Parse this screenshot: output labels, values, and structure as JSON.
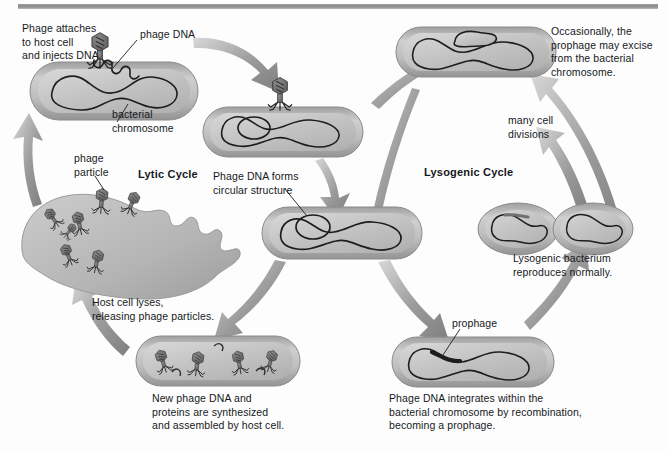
{
  "figure": {
    "title_bar": "",
    "cycles": [
      {
        "id": "lytic",
        "label": "Lytic Cycle"
      },
      {
        "id": "lysogenic",
        "label": "Lysogenic Cycle"
      }
    ],
    "labels": [
      {
        "name": "phage-attaches-caption",
        "text": "Phage attaches\nto host cell\nand injects DNA.",
        "x": 22,
        "y": 22
      },
      {
        "name": "phage-dna-label",
        "text": "phage DNA",
        "x": 140,
        "y": 28
      },
      {
        "name": "bacterial-chromosome-label",
        "text": "bacterial\nchromosome",
        "x": 112,
        "y": 108
      },
      {
        "name": "phage-particle-label",
        "text": "phage\nparticle",
        "x": 74,
        "y": 152
      },
      {
        "name": "lytic-cycle-label",
        "text": "Lytic Cycle",
        "x": 138,
        "y": 168
      },
      {
        "name": "circular-structure-caption",
        "text": "Phage DNA forms\ncircular structure",
        "x": 213,
        "y": 170
      },
      {
        "name": "host-cell-lyses-caption",
        "text": "Host cell lyses,\nreleasing phage particles.",
        "x": 92,
        "y": 296
      },
      {
        "name": "new-phage-dna-caption",
        "text": "New phage DNA and\nproteins are synthesized\nand assembled by host cell.",
        "x": 152,
        "y": 392
      },
      {
        "name": "lysogenic-cycle-label",
        "text": "Lysogenic Cycle",
        "x": 424,
        "y": 166
      },
      {
        "name": "occasionally-excise-caption",
        "text": "Occasionally, the\nprophage may excise\nfrom the bacterial\nchromosome.",
        "x": 551,
        "y": 25
      },
      {
        "name": "many-cell-divisions-label",
        "text": "many cell\ndivisions",
        "x": 508,
        "y": 114
      },
      {
        "name": "lysogenic-bacterium-caption",
        "text": "Lysogenic bacterium\nreproduces normally.",
        "x": 513,
        "y": 252
      },
      {
        "name": "prophage-label",
        "text": "prophage",
        "x": 452,
        "y": 317
      },
      {
        "name": "phage-dna-integrates-caption",
        "text": "Phage DNA integrates within the\nbacterial chromosome by recombination,\nbecoming a prophage.",
        "x": 389,
        "y": 392
      }
    ],
    "cells": [
      {
        "name": "host-cell-infected",
        "stage": "Phage attaches to host cell and injects DNA."
      },
      {
        "name": "cell-circularizing-dna",
        "stage": "Phage DNA forms circular structure"
      },
      {
        "name": "central-cell-with-circular-dna",
        "stage": "Decision point between lytic and lysogenic"
      },
      {
        "name": "cell-new-phages-assembled",
        "stage": "New phage DNA and proteins are synthesized and assembled by host cell."
      },
      {
        "name": "lysed-host-cell",
        "stage": "Host cell lyses, releasing phage particles."
      },
      {
        "name": "cell-with-prophage",
        "stage": "Phage DNA integrates within the bacterial chromosome by recombination, becoming a prophage."
      },
      {
        "name": "dividing-lysogenic-bacteria",
        "stage": "Lysogenic bacterium reproduces normally."
      },
      {
        "name": "cell-prophage-excising",
        "stage": "Occasionally, the prophage may excise from the bacterial chromosome."
      }
    ],
    "colors": {
      "cell_membrane": "#8e8e8e",
      "cell_cytoplasm": "#c9c9c9",
      "chromosome_line": "#1d1d1d",
      "phage_body": "#6f6f6f",
      "arrow": "#8c8c8c",
      "background": "#fdfdfd",
      "text": "#16191c"
    }
  }
}
